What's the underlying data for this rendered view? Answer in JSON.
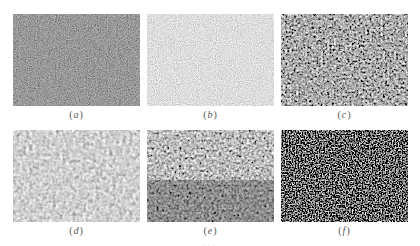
{
  "figure": {
    "panels": [
      {
        "id": "a",
        "label": "a",
        "tone": "dark",
        "description": "dark grayscale micrograph texture with sparse bright specks"
      },
      {
        "id": "b",
        "label": "b",
        "tone": "light-gray",
        "description": "uniform fine-grained light gray texture"
      },
      {
        "id": "c",
        "label": "c",
        "tone": "mottled-dark",
        "description": "mottled medium-gray texture with dark patches"
      },
      {
        "id": "d",
        "label": "d",
        "tone": "gray-cellular",
        "description": "light gray cellular texture with darker round grains"
      },
      {
        "id": "e",
        "label": "e",
        "tone": "mixed",
        "description": "mixed gray texture, lighter top, darker lower region"
      },
      {
        "id": "f",
        "label": "f",
        "tone": "black-specks",
        "description": "near-black background with scattered bright specks"
      }
    ],
    "caption": "..."
  }
}
